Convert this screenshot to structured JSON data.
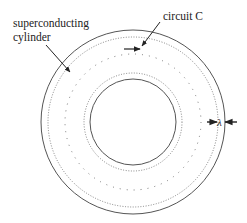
{
  "diagram": {
    "labels": {
      "cylinder_line1": "superconducting",
      "cylinder_line2": "cylinder",
      "circuit": "circuit C",
      "penetration_depth": "λ"
    },
    "colors": {
      "stroke": "#444444",
      "text": "#222222",
      "background": "#ffffff"
    },
    "geometry": {
      "center": [
        133,
        122
      ],
      "outer_solid_radius": 92,
      "outer_dotted_radius": 85,
      "circuit_dotted_radius": 68,
      "inner_dotted_radius": 49,
      "inner_solid_radius": 43
    }
  }
}
